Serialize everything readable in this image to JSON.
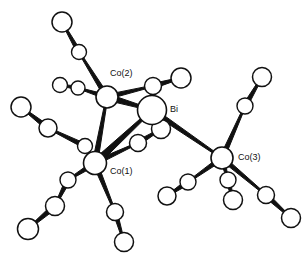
{
  "figure": {
    "type": "molecular-structure-diagram",
    "style": "ball-and-stick crystallographic drawing",
    "background_color": "#ffffff",
    "line_color": "#111111",
    "atom_fill_color": "#ffffff",
    "width": 308,
    "height": 257
  },
  "labels": [
    {
      "id": "co2",
      "text": "Co(2)",
      "x": 110,
      "y": 74
    },
    {
      "id": "bi",
      "text": "Bi",
      "x": 170,
      "y": 110
    },
    {
      "id": "co3",
      "text": "Co(3)",
      "x": 238,
      "y": 158
    },
    {
      "id": "co1",
      "text": "Co(1)",
      "x": 110,
      "y": 172
    }
  ],
  "atoms": [
    {
      "id": "bi",
      "element": "Bi",
      "x": 152,
      "y": 110,
      "r": 14.5,
      "sw": 1.6,
      "labeled": true
    },
    {
      "id": "co1",
      "element": "Co",
      "x": 95,
      "y": 163,
      "r": 11.5,
      "sw": 1.6,
      "labeled": true
    },
    {
      "id": "co2",
      "element": "Co",
      "x": 107,
      "y": 97,
      "r": 11.0,
      "sw": 1.6,
      "labeled": true
    },
    {
      "id": "co3",
      "element": "Co",
      "x": 222,
      "y": 158,
      "r": 11.0,
      "sw": 1.6,
      "labeled": true
    },
    {
      "id": "c2a",
      "element": "C",
      "x": 79,
      "y": 52,
      "r": 7.5,
      "sw": 1.4,
      "labeled": false
    },
    {
      "id": "o2a",
      "element": "O",
      "x": 62,
      "y": 22,
      "r": 10.0,
      "sw": 1.5,
      "labeled": false
    },
    {
      "id": "c2b",
      "element": "C",
      "x": 78,
      "y": 88,
      "r": 7.0,
      "sw": 1.4,
      "labeled": false
    },
    {
      "id": "o2b",
      "element": "O",
      "x": 60,
      "y": 85,
      "r": 7.5,
      "sw": 1.4,
      "labeled": false
    },
    {
      "id": "c2c",
      "element": "C",
      "x": 153,
      "y": 86,
      "r": 8.5,
      "sw": 1.5,
      "labeled": false
    },
    {
      "id": "o2c",
      "element": "O",
      "x": 181,
      "y": 78,
      "r": 10.0,
      "sw": 1.5,
      "labeled": false
    },
    {
      "id": "c1a",
      "element": "C",
      "x": 85,
      "y": 146,
      "r": 7.5,
      "sw": 1.4,
      "labeled": false
    },
    {
      "id": "c1b",
      "element": "C",
      "x": 48,
      "y": 128,
      "r": 9.0,
      "sw": 1.5,
      "labeled": false
    },
    {
      "id": "o1b",
      "element": "O",
      "x": 21,
      "y": 107,
      "r": 10.0,
      "sw": 1.5,
      "labeled": false
    },
    {
      "id": "c1c",
      "element": "C",
      "x": 68,
      "y": 180,
      "r": 8.0,
      "sw": 1.4,
      "labeled": false
    },
    {
      "id": "c1d",
      "element": "C",
      "x": 55,
      "y": 206,
      "r": 9.5,
      "sw": 1.5,
      "labeled": false
    },
    {
      "id": "o1d",
      "element": "O",
      "x": 28,
      "y": 229,
      "r": 10.5,
      "sw": 1.5,
      "labeled": false
    },
    {
      "id": "c1e",
      "element": "C",
      "x": 115,
      "y": 212,
      "r": 8.5,
      "sw": 1.5,
      "labeled": false
    },
    {
      "id": "o1e",
      "element": "O",
      "x": 124,
      "y": 242,
      "r": 9.5,
      "sw": 1.5,
      "labeled": false
    },
    {
      "id": "c1f",
      "element": "C",
      "x": 138,
      "y": 143,
      "r": 8.5,
      "sw": 1.5,
      "labeled": false
    },
    {
      "id": "o1f",
      "element": "O",
      "x": 161,
      "y": 129,
      "r": 9.5,
      "sw": 1.5,
      "labeled": false
    },
    {
      "id": "c3a",
      "element": "C",
      "x": 245,
      "y": 106,
      "r": 8.0,
      "sw": 1.4,
      "labeled": false
    },
    {
      "id": "o3a",
      "element": "O",
      "x": 262,
      "y": 77,
      "r": 9.5,
      "sw": 1.5,
      "labeled": false
    },
    {
      "id": "c3b",
      "element": "C",
      "x": 266,
      "y": 195,
      "r": 8.5,
      "sw": 1.5,
      "labeled": false
    },
    {
      "id": "o3b",
      "element": "O",
      "x": 291,
      "y": 218,
      "r": 9.5,
      "sw": 1.5,
      "labeled": false
    },
    {
      "id": "c3c",
      "element": "C",
      "x": 188,
      "y": 182,
      "r": 8.0,
      "sw": 1.4,
      "labeled": false
    },
    {
      "id": "o3c",
      "element": "O",
      "x": 167,
      "y": 196,
      "r": 9.0,
      "sw": 1.5,
      "labeled": false
    },
    {
      "id": "c3d",
      "element": "C",
      "x": 228,
      "y": 180,
      "r": 8.0,
      "sw": 1.4,
      "labeled": false
    },
    {
      "id": "o3d",
      "element": "O",
      "x": 233,
      "y": 200,
      "r": 9.5,
      "sw": 1.5,
      "labeled": false
    }
  ],
  "bonds": [
    {
      "from": "co2",
      "to": "bi",
      "w": 6.0,
      "kind": "metal-metal"
    },
    {
      "from": "co1",
      "to": "bi",
      "w": 6.5,
      "kind": "metal-metal"
    },
    {
      "from": "co1",
      "to": "co2",
      "w": 5.0,
      "kind": "metal-metal"
    },
    {
      "from": "bi",
      "to": "co3",
      "w": 5.0,
      "kind": "metal-metal"
    },
    {
      "from": "co2",
      "to": "c2a",
      "w": 4.5,
      "kind": "metal-carbonyl"
    },
    {
      "from": "c2a",
      "to": "o2a",
      "w": 4.0,
      "kind": "carbonyl"
    },
    {
      "from": "co2",
      "to": "c2b",
      "w": 4.0,
      "kind": "metal-carbonyl"
    },
    {
      "from": "c2b",
      "to": "o2b",
      "w": 3.5,
      "kind": "carbonyl"
    },
    {
      "from": "co2",
      "to": "c2c",
      "w": 4.5,
      "kind": "metal-carbonyl"
    },
    {
      "from": "c2c",
      "to": "o2c",
      "w": 4.5,
      "kind": "carbonyl"
    },
    {
      "from": "co1",
      "to": "c1a",
      "w": 4.0,
      "kind": "metal-carbonyl"
    },
    {
      "from": "c1a",
      "to": "c1b",
      "w": 4.5,
      "kind": "carbonyl"
    },
    {
      "from": "c1b",
      "to": "o1b",
      "w": 4.5,
      "kind": "carbonyl"
    },
    {
      "from": "co1",
      "to": "c1c",
      "w": 4.5,
      "kind": "metal-carbonyl"
    },
    {
      "from": "c1c",
      "to": "c1d",
      "w": 4.5,
      "kind": "carbonyl"
    },
    {
      "from": "c1d",
      "to": "o1d",
      "w": 5.0,
      "kind": "carbonyl"
    },
    {
      "from": "co1",
      "to": "c1e",
      "w": 4.5,
      "kind": "metal-carbonyl"
    },
    {
      "from": "c1e",
      "to": "o1e",
      "w": 4.0,
      "kind": "carbonyl"
    },
    {
      "from": "co1",
      "to": "c1f",
      "w": 4.5,
      "kind": "metal-carbonyl"
    },
    {
      "from": "c1f",
      "to": "o1f",
      "w": 4.5,
      "kind": "carbonyl"
    },
    {
      "from": "co3",
      "to": "c3a",
      "w": 4.5,
      "kind": "metal-carbonyl"
    },
    {
      "from": "c3a",
      "to": "o3a",
      "w": 4.5,
      "kind": "carbonyl"
    },
    {
      "from": "co3",
      "to": "c3b",
      "w": 4.5,
      "kind": "metal-carbonyl"
    },
    {
      "from": "c3b",
      "to": "o3b",
      "w": 4.5,
      "kind": "carbonyl"
    },
    {
      "from": "co3",
      "to": "c3c",
      "w": 4.5,
      "kind": "metal-carbonyl"
    },
    {
      "from": "c3c",
      "to": "o3c",
      "w": 4.5,
      "kind": "carbonyl"
    },
    {
      "from": "co3",
      "to": "c3d",
      "w": 4.0,
      "kind": "metal-carbonyl"
    },
    {
      "from": "c3d",
      "to": "o3d",
      "w": 4.0,
      "kind": "carbonyl"
    }
  ],
  "draw_order": [
    "c2a",
    "o2a",
    "c2b",
    "o2b",
    "c2c",
    "o2c",
    "c1b",
    "o1b",
    "c1d",
    "o1d",
    "c1e",
    "o1e",
    "c3a",
    "o3a",
    "c3b",
    "o3b",
    "c3c",
    "o3c",
    "c1a",
    "c1c",
    "c1f",
    "o1f",
    "c3d",
    "o3d",
    "co2",
    "co1",
    "bi",
    "co3"
  ]
}
